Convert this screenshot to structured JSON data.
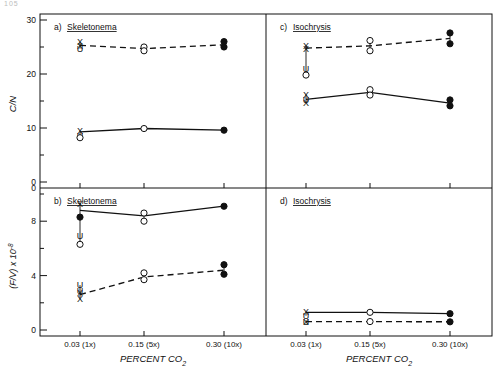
{
  "figure": {
    "corner_mark": "105",
    "background": "#ffffff",
    "ink": "#111111"
  },
  "axes": {
    "x_title": "PERCENT CO",
    "x_title_sub": "2",
    "x_tick_labels": [
      "0.03 (1x)",
      "0.15 (5x)",
      "0.30 (10x)"
    ],
    "x_values": [
      0.03,
      0.15,
      0.3
    ],
    "y_title_top": "C/N",
    "y_title_bottom": "(F/V) x 10",
    "y_title_bottom_sup": "-8",
    "y_top_ticks": [
      0,
      5,
      10,
      15,
      20,
      25,
      30
    ],
    "y_top_labels": [
      "0",
      "10",
      "20",
      "30"
    ],
    "y_bottom_ticks": [
      0,
      2,
      4,
      6,
      8,
      10
    ],
    "y_bottom_labels": [
      "0",
      "4",
      "8"
    ]
  },
  "panels": [
    {
      "id": "a",
      "tag": "a)",
      "species": "Skeletonema",
      "position": "top-left"
    },
    {
      "id": "c",
      "tag": "c)",
      "species": "Isochrysis",
      "position": "top-right"
    },
    {
      "id": "b",
      "tag": "b)",
      "species": "Skeletonema",
      "position": "bottom-left"
    },
    {
      "id": "d",
      "tag": "d)",
      "species": "Isochrysis",
      "position": "bottom-right"
    }
  ],
  "chart_data": [
    {
      "type": "line",
      "panel": "a",
      "title": "a) Skeletonema",
      "xlabel": "PERCENT CO2",
      "ylabel": "C/N",
      "xlim": [
        0,
        0.345
      ],
      "ylim": [
        0,
        30
      ],
      "x": [
        0.03,
        0.15,
        0.3
      ],
      "xtick_labels": [
        "0.03 (1x)",
        "0.15 (5x)",
        "0.30 (10x)"
      ],
      "grid": false,
      "legend": "none",
      "series": [
        {
          "name": "dashed-upper",
          "style": "dashed",
          "values": [
            25.3,
            24.7,
            25.4
          ],
          "markers": [
            {
              "x": 0.03,
              "y": 25.9,
              "type": "x"
            },
            {
              "x": 0.03,
              "y": 25.2,
              "type": "x"
            },
            {
              "x": 0.03,
              "y": 24.7,
              "type": "u"
            },
            {
              "x": 0.15,
              "y": 25.0,
              "type": "open-circle"
            },
            {
              "x": 0.15,
              "y": 24.3,
              "type": "open-circle"
            },
            {
              "x": 0.3,
              "y": 26.0,
              "type": "filled-circle"
            },
            {
              "x": 0.3,
              "y": 25.0,
              "type": "filled-circle"
            }
          ]
        },
        {
          "name": "solid-lower",
          "style": "solid",
          "values": [
            9.3,
            9.9,
            9.6
          ],
          "markers": [
            {
              "x": 0.03,
              "y": 9.5,
              "type": "x"
            },
            {
              "x": 0.03,
              "y": 8.5,
              "type": "u"
            },
            {
              "x": 0.03,
              "y": 8.2,
              "type": "open-circle"
            },
            {
              "x": 0.15,
              "y": 9.9,
              "type": "open-circle"
            },
            {
              "x": 0.3,
              "y": 9.6,
              "type": "filled-circle"
            }
          ]
        }
      ],
      "annotations": [
        "U",
        "U",
        "X"
      ]
    },
    {
      "type": "line",
      "panel": "c",
      "title": "c) Isochrysis",
      "xlabel": "PERCENT CO2",
      "ylabel": "C/N",
      "xlim": [
        0,
        0.345
      ],
      "ylim": [
        0,
        30
      ],
      "x": [
        0.03,
        0.15,
        0.3
      ],
      "xtick_labels": [
        "0.03 (1x)",
        "0.15 (5x)",
        "0.30 (10x)"
      ],
      "grid": false,
      "legend": "none",
      "series": [
        {
          "name": "dashed-upper",
          "style": "dashed",
          "values": [
            24.8,
            25.2,
            26.6
          ],
          "markers": [
            {
              "x": 0.03,
              "y": 25.3,
              "type": "x"
            },
            {
              "x": 0.03,
              "y": 24.6,
              "type": "x"
            },
            {
              "x": 0.03,
              "y": 20.9,
              "type": "u"
            },
            {
              "x": 0.03,
              "y": 19.8,
              "type": "open-circle"
            },
            {
              "x": 0.15,
              "y": 26.2,
              "type": "open-circle"
            },
            {
              "x": 0.15,
              "y": 24.3,
              "type": "open-circle"
            },
            {
              "x": 0.3,
              "y": 27.6,
              "type": "filled-circle"
            },
            {
              "x": 0.3,
              "y": 25.6,
              "type": "filled-circle"
            }
          ]
        },
        {
          "name": "solid-lower",
          "style": "solid",
          "values": [
            15.3,
            16.6,
            14.6
          ],
          "markers": [
            {
              "x": 0.03,
              "y": 16.2,
              "type": "x"
            },
            {
              "x": 0.03,
              "y": 15.2,
              "type": "u"
            },
            {
              "x": 0.03,
              "y": 14.7,
              "type": "x"
            },
            {
              "x": 0.15,
              "y": 17.1,
              "type": "open-circle"
            },
            {
              "x": 0.15,
              "y": 16.1,
              "type": "open-circle"
            },
            {
              "x": 0.3,
              "y": 15.2,
              "type": "filled-circle"
            },
            {
              "x": 0.3,
              "y": 14.1,
              "type": "filled-circle"
            }
          ]
        }
      ],
      "annotations": [
        "U",
        "O",
        "X"
      ]
    },
    {
      "type": "line",
      "panel": "b",
      "title": "b) Skeletonema",
      "xlabel": "PERCENT CO2",
      "ylabel": "(F/V) x 10^-8",
      "xlim": [
        0,
        0.345
      ],
      "ylim": [
        0,
        10
      ],
      "x": [
        0.03,
        0.15,
        0.3
      ],
      "xtick_labels": [
        "0.03 (1x)",
        "0.15 (5x)",
        "0.30 (10x)"
      ],
      "grid": false,
      "legend": "none",
      "series": [
        {
          "name": "solid-upper",
          "style": "solid",
          "values": [
            8.8,
            8.4,
            9.1
          ],
          "markers": [
            {
              "x": 0.03,
              "y": 9.3,
              "type": "x"
            },
            {
              "x": 0.03,
              "y": 8.3,
              "type": "filled-circle"
            },
            {
              "x": 0.03,
              "y": 6.9,
              "type": "u"
            },
            {
              "x": 0.03,
              "y": 6.3,
              "type": "open-circle"
            },
            {
              "x": 0.15,
              "y": 8.6,
              "type": "open-circle"
            },
            {
              "x": 0.15,
              "y": 8.0,
              "type": "open-circle"
            },
            {
              "x": 0.3,
              "y": 9.1,
              "type": "filled-circle"
            }
          ]
        },
        {
          "name": "dashed-lower",
          "style": "dashed",
          "values": [
            2.6,
            3.9,
            4.4
          ],
          "markers": [
            {
              "x": 0.03,
              "y": 3.3,
              "type": "u"
            },
            {
              "x": 0.03,
              "y": 2.9,
              "type": "u"
            },
            {
              "x": 0.03,
              "y": 2.7,
              "type": "x"
            },
            {
              "x": 0.03,
              "y": 2.3,
              "type": "x"
            },
            {
              "x": 0.15,
              "y": 4.2,
              "type": "open-circle"
            },
            {
              "x": 0.15,
              "y": 3.7,
              "type": "open-circle"
            },
            {
              "x": 0.3,
              "y": 4.8,
              "type": "filled-circle"
            },
            {
              "x": 0.3,
              "y": 4.1,
              "type": "filled-circle"
            }
          ]
        }
      ],
      "annotations": [
        "U",
        "U",
        "X",
        "X",
        "O"
      ]
    },
    {
      "type": "line",
      "panel": "d",
      "title": "d) Isochrysis",
      "xlabel": "PERCENT CO2",
      "ylabel": "(F/V) x 10^-8",
      "xlim": [
        0,
        0.345
      ],
      "ylim": [
        0,
        10
      ],
      "x": [
        0.03,
        0.15,
        0.3
      ],
      "xtick_labels": [
        "0.03 (1x)",
        "0.15 (5x)",
        "0.30 (10x)"
      ],
      "grid": false,
      "legend": "none",
      "series": [
        {
          "name": "solid-upper",
          "style": "solid",
          "values": [
            1.3,
            1.3,
            1.2
          ],
          "markers": [
            {
              "x": 0.03,
              "y": 1.35,
              "type": "x"
            },
            {
              "x": 0.03,
              "y": 1.05,
              "type": "u"
            },
            {
              "x": 0.15,
              "y": 1.3,
              "type": "open-circle"
            },
            {
              "x": 0.3,
              "y": 1.2,
              "type": "filled-circle"
            }
          ]
        },
        {
          "name": "dashed-lower",
          "style": "dashed",
          "values": [
            0.62,
            0.62,
            0.6
          ],
          "markers": [
            {
              "x": 0.03,
              "y": 0.62,
              "type": "u"
            },
            {
              "x": 0.03,
              "y": 0.62,
              "type": "x"
            },
            {
              "x": 0.15,
              "y": 0.62,
              "type": "open-circle"
            },
            {
              "x": 0.3,
              "y": 0.6,
              "type": "filled-circle"
            }
          ]
        }
      ],
      "annotations": [
        "U",
        "X"
      ]
    }
  ]
}
